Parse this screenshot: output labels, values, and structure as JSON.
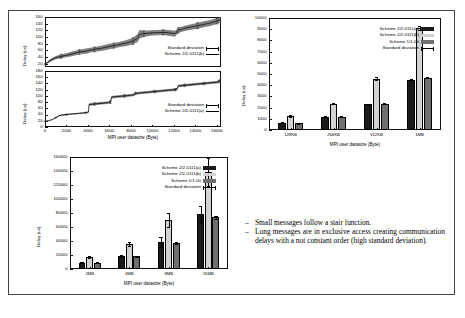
{
  "chart_data": [
    {
      "id": "delay-small-b",
      "type": "line",
      "title": "",
      "xlabel": "",
      "ylabel": "Delay (us)",
      "xlim": [
        0,
        16384
      ],
      "ylim": [
        10,
        160
      ],
      "yticks": [
        20,
        40,
        60,
        80,
        100,
        120,
        140,
        160
      ],
      "xticks": [
        0,
        2000,
        4000,
        6000,
        8000,
        10000,
        12000,
        14000,
        16000
      ],
      "grid": false,
      "legend": [
        {
          "label": "Standard deviation",
          "kind": "errorbar"
        },
        {
          "label": "Scheme 2/2-0111(b)",
          "kind": "line"
        }
      ],
      "series": [
        {
          "name": "Scheme 2/2-0111(b)",
          "x": [
            0,
            500,
            1000,
            1500,
            2000,
            2600,
            3200,
            3900,
            4100,
            4600,
            5200,
            5800,
            6400,
            7000,
            7600,
            8200,
            8600,
            8800,
            9200,
            9800,
            10400,
            11000,
            11600,
            12100,
            12400,
            13000,
            13600,
            14200,
            14800,
            15400,
            16000,
            16384
          ],
          "y": [
            18,
            30,
            38,
            42,
            45,
            50,
            55,
            58,
            60,
            63,
            66,
            70,
            74,
            78,
            82,
            88,
            96,
            108,
            110,
            112,
            113,
            114,
            112,
            110,
            120,
            126,
            130,
            134,
            138,
            142,
            148,
            152
          ],
          "stdev": [
            2,
            4,
            5,
            6,
            6,
            7,
            7,
            8,
            7,
            7,
            8,
            8,
            8,
            8,
            9,
            10,
            12,
            13,
            9,
            8,
            8,
            8,
            9,
            9,
            8,
            8,
            8,
            9,
            9,
            9,
            9,
            9
          ]
        }
      ]
    },
    {
      "id": "delay-small-a",
      "type": "line",
      "title": "",
      "xlabel": "MPI user datasize (Byte)",
      "ylabel": "Delay (us)",
      "xlim": [
        0,
        16384
      ],
      "ylim": [
        0,
        180
      ],
      "yticks": [
        0,
        20,
        40,
        60,
        80,
        100,
        120,
        140,
        160,
        180
      ],
      "xticks": [
        0,
        2000,
        4000,
        6000,
        8000,
        10000,
        12000,
        14000,
        16000
      ],
      "grid": false,
      "legend": [
        {
          "label": "Standard deviation",
          "kind": "errorbar"
        },
        {
          "label": "Scheme 2/2-0111(a)",
          "kind": "line"
        }
      ],
      "series": [
        {
          "name": "Scheme 2/2-0111(a)",
          "x": [
            0,
            300,
            700,
            1000,
            1300,
            1500,
            2000,
            2600,
            3200,
            3800,
            4050,
            4100,
            4600,
            5200,
            5800,
            6100,
            6200,
            6800,
            7400,
            8000,
            8300,
            8400,
            9000,
            9600,
            10200,
            10800,
            11400,
            12100,
            12300,
            12400,
            13000,
            13600,
            14200,
            14800,
            15400,
            16000,
            16200,
            16384
          ],
          "y": [
            18,
            20,
            24,
            30,
            36,
            38,
            40,
            42,
            44,
            46,
            48,
            72,
            74,
            76,
            78,
            80,
            96,
            98,
            100,
            102,
            104,
            108,
            110,
            112,
            114,
            116,
            118,
            120,
            122,
            132,
            134,
            136,
            138,
            140,
            142,
            144,
            146,
            158
          ],
          "stdev": [
            1,
            1,
            1,
            1,
            2,
            2,
            2,
            2,
            2,
            2,
            2,
            4,
            4,
            4,
            4,
            4,
            4,
            4,
            4,
            4,
            4,
            4,
            4,
            4,
            4,
            4,
            4,
            4,
            4,
            4,
            4,
            4,
            4,
            4,
            4,
            4,
            4,
            4
          ]
        }
      ]
    },
    {
      "id": "delay-medium",
      "type": "bar",
      "title": "",
      "xlabel": "MPI user datasize (Byte)",
      "ylabel": "Delay (us)",
      "categories": [
        "128KB",
        "256KB",
        "512KB",
        "1MB"
      ],
      "ylim": [
        0,
        10000
      ],
      "yticks": [
        0,
        1000,
        2000,
        3000,
        4000,
        5000,
        6000,
        7000,
        8000,
        9000,
        10000
      ],
      "grid": false,
      "legend_position": "top-center",
      "series": [
        {
          "name": "Scheme 2/2-0111(a)",
          "color": "#1a1a1a",
          "values": [
            640,
            1200,
            2300,
            4500
          ],
          "stdev": [
            40,
            40,
            60,
            80
          ]
        },
        {
          "name": "Scheme 2/2-0111(b)",
          "color": "#d2d2d2",
          "values": [
            1220,
            2360,
            4580,
            9120
          ],
          "stdev": [
            90,
            80,
            120,
            160
          ]
        },
        {
          "name": "Scheme 1/1-00",
          "color": "#6f6f6f",
          "values": [
            620,
            1180,
            2360,
            4680
          ],
          "stdev": [
            40,
            40,
            60,
            80
          ]
        }
      ],
      "legend_extra": "Standard deviation"
    },
    {
      "id": "delay-large",
      "type": "bar",
      "title": "",
      "xlabel": "MPI user datasize (Byte)",
      "ylabel": "Delay (us)",
      "categories": [
        "2MB",
        "4MB",
        "8MB",
        "16MB"
      ],
      "ylim": [
        0,
        160000
      ],
      "yticks": [
        0,
        20000,
        40000,
        60000,
        80000,
        100000,
        120000,
        140000,
        160000
      ],
      "grid": false,
      "legend_position": "top-center",
      "series": [
        {
          "name": "Scheme 2/2-0111(a)",
          "color": "#1a1a1a",
          "values": [
            9000,
            18500,
            38500,
            78000
          ],
          "stdev": [
            800,
            1500,
            7000,
            12000
          ]
        },
        {
          "name": "Scheme 2/2-0111(b)",
          "color": "#d2d2d2",
          "values": [
            17500,
            35500,
            70000,
            138000
          ],
          "stdev": [
            1500,
            2500,
            9500,
            20000
          ]
        },
        {
          "name": "Scheme 1/1-00",
          "color": "#6f6f6f",
          "values": [
            9200,
            18300,
            37000,
            74000
          ],
          "stdev": [
            700,
            900,
            1500,
            2000
          ]
        }
      ],
      "legend_extra": "Standard deviation"
    }
  ],
  "bullets": [
    {
      "dash": "–",
      "text": "Small messages follow a stair function."
    },
    {
      "dash": "–",
      "text": "Long messages are in exclusive access creating communication delays with a not constant order (high standard deviation)."
    }
  ]
}
